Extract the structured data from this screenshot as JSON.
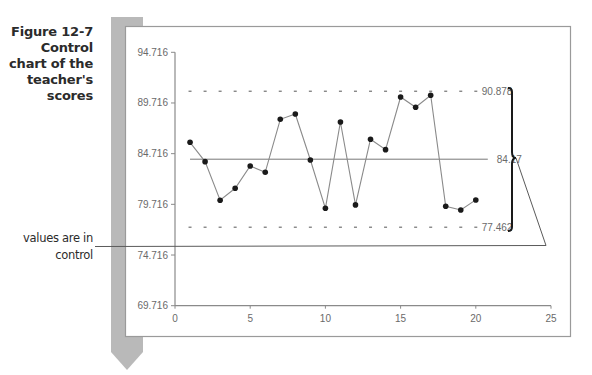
{
  "caption": {
    "lines": [
      "Figure 12-7",
      "Control",
      "chart of the",
      "teacher's",
      "scores"
    ]
  },
  "callout": {
    "lines": [
      "values are in",
      "control"
    ]
  },
  "colors": {
    "sidebar_bar": "#b5b5b5",
    "axis": "#8a8a8a",
    "series_line": "#8a8a8a",
    "marker": "#1a1a1a",
    "bracket": "#1a1a1a",
    "frame": "#9a9a9a"
  },
  "chart_data": {
    "type": "line",
    "title": "Control chart of the teacher's scores",
    "xlabel": "",
    "ylabel": "",
    "xlim": [
      0,
      25
    ],
    "ylim": [
      69.716,
      94.716
    ],
    "x_ticks": [
      "0",
      "5",
      "10",
      "15",
      "20",
      "25"
    ],
    "y_ticks": [
      "69.716",
      "74.716",
      "79.716",
      "84.716",
      "89.716",
      "94.716"
    ],
    "grid": false,
    "legend": null,
    "x": [
      1,
      2,
      3,
      4,
      5,
      6,
      7,
      8,
      9,
      10,
      11,
      12,
      13,
      14,
      15,
      16,
      17,
      18,
      19,
      20
    ],
    "series": [
      {
        "name": "Scores",
        "values": [
          85.84,
          83.93,
          80.12,
          81.3,
          83.5,
          82.88,
          88.11,
          88.63,
          84.09,
          79.33,
          87.84,
          79.66,
          86.14,
          85.11,
          90.31,
          89.29,
          90.48,
          79.53,
          79.16,
          80.15
        ]
      }
    ],
    "reference_lines": [
      {
        "name": "UCL",
        "value": 90.878,
        "label": "90.878",
        "style": "dashed"
      },
      {
        "name": "Center line",
        "value": 84.17,
        "label": "84.17",
        "style": "solid"
      },
      {
        "name": "LCL",
        "value": 77.462,
        "label": "77.462",
        "style": "dashed"
      }
    ],
    "annotations": [
      "values are in control"
    ]
  }
}
